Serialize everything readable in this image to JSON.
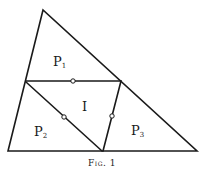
{
  "figure": {
    "caption": "Fig. 1",
    "regions": [
      {
        "id": "P1",
        "main": "P",
        "sub": "1"
      },
      {
        "id": "P2",
        "main": "P",
        "sub": "2"
      },
      {
        "id": "P3",
        "main": "P",
        "sub": "3"
      },
      {
        "id": "I",
        "main": "I",
        "sub": ""
      }
    ],
    "colors": {
      "line": "#1a1a1a",
      "background": "#ffffff"
    }
  }
}
